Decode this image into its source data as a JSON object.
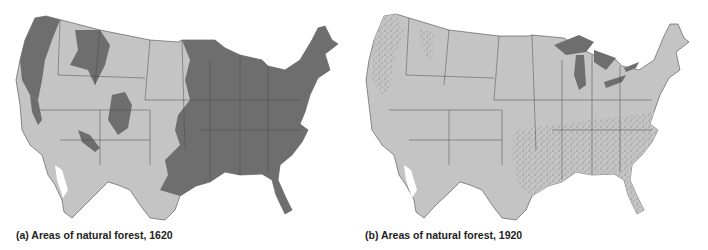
{
  "figure": {
    "panels": [
      {
        "id": "a",
        "caption": "(a) Areas of natural forest, 1620",
        "subject": "Contiguous United States",
        "year": 1620,
        "legend_colors": {
          "forest": "#6e6e6e",
          "non_forest": "#c4c4c4",
          "water": "#ffffff",
          "borders": "#4a4a4a"
        }
      },
      {
        "id": "b",
        "caption": "(b) Areas of natural forest, 1920",
        "subject": "Contiguous United States",
        "year": 1920,
        "legend_colors": {
          "forest": "#6e6e6e",
          "non_forest": "#c4c4c4",
          "lakes": "#6e6e6e",
          "borders": "#4a4a4a"
        }
      }
    ]
  }
}
